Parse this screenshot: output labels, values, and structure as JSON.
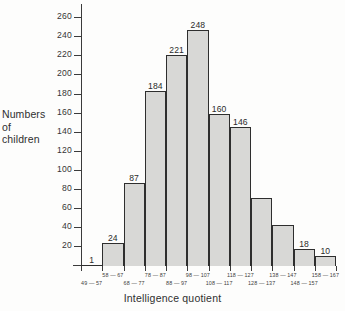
{
  "chart_data": {
    "type": "bar",
    "title": "",
    "xlabel": "Intelligence quotient",
    "ylabel": "Numbers of children",
    "ylabel_lines": [
      "Numbers",
      "of",
      "children"
    ],
    "categories": [
      "49 — 57",
      "58 — 67",
      "68 — 77",
      "78 — 87",
      "88 — 97",
      "98 — 107",
      "108 — 117",
      "118 — 127",
      "128 — 137",
      "138 — 147",
      "148 — 157",
      "158 — 167"
    ],
    "values": [
      1,
      24,
      87,
      184,
      221,
      248,
      160,
      146,
      71,
      43,
      18,
      10
    ],
    "bar_labels": [
      "1",
      "24",
      "87",
      "184",
      "221",
      "248",
      "160",
      "146",
      "",
      "",
      "18",
      "10"
    ],
    "ylim": [
      0,
      275
    ],
    "yticks": [
      20,
      40,
      60,
      80,
      100,
      120,
      140,
      160,
      180,
      200,
      220,
      240,
      260
    ],
    "ytick_labels": [
      "20",
      "40",
      "60",
      "80",
      "100",
      "120",
      "140",
      "160",
      "180",
      "200",
      "220",
      "240",
      "260"
    ],
    "xtick_labels_top": [
      "58 — 67",
      "78 — 87",
      "98 — 107",
      "118 — 127",
      "138 — 147",
      "158 — 167"
    ],
    "xtick_labels_bottom": [
      "49 — 57",
      "68 — 77",
      "88 — 97",
      "108 — 117",
      "128 — 137",
      "148 — 157"
    ],
    "grid": false,
    "legend": false,
    "colors": {
      "bar_fill": "#d8d8d6",
      "bar_edge": "#2e2e2e",
      "axis": "#3b3b3b",
      "text": "#2f2f2f",
      "background": "#fdfdfc"
    }
  }
}
